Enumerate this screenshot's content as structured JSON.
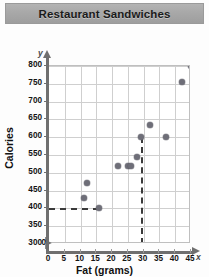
{
  "header": {
    "title": "Restaurant Sandwiches"
  },
  "chart_data": {
    "type": "scatter",
    "title": "Restaurant Sandwiches",
    "xlabel": "Fat (grams)",
    "ylabel": "Calories",
    "x_symbol": "x",
    "y_symbol": "y",
    "xlim": [
      0,
      45
    ],
    "ylim": [
      300,
      800
    ],
    "y_axis_break": true,
    "y_origin_label": "0",
    "grid": true,
    "legend": null,
    "xticks": [
      0,
      5,
      10,
      15,
      20,
      25,
      30,
      35,
      40,
      45
    ],
    "yticks": [
      300,
      350,
      400,
      450,
      500,
      550,
      600,
      650,
      700,
      750,
      800
    ],
    "points": [
      {
        "x": 11,
        "y": 430
      },
      {
        "x": 12,
        "y": 470
      },
      {
        "x": 16,
        "y": 400
      },
      {
        "x": 22,
        "y": 520
      },
      {
        "x": 25,
        "y": 520
      },
      {
        "x": 26,
        "y": 520
      },
      {
        "x": 28,
        "y": 545
      },
      {
        "x": 29,
        "y": 600
      },
      {
        "x": 32,
        "y": 635
      },
      {
        "x": 37,
        "y": 600
      },
      {
        "x": 42,
        "y": 755
      },
      {
        "x": 45,
        "y": 800
      }
    ],
    "annotations": [
      {
        "type": "dashed-horizontal",
        "y": 400,
        "x_from": 0,
        "x_to": 16
      },
      {
        "type": "dashed-vertical",
        "x": 29,
        "y_from": 300,
        "y_to": 600
      }
    ],
    "point_color": "#6e6e78",
    "grid_color": "#cfcfcf",
    "dash_color": "#3a3a3a"
  }
}
